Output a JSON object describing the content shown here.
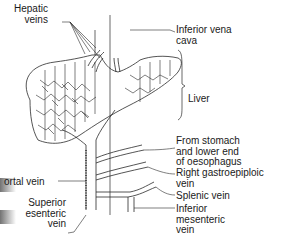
{
  "labels": {
    "hepatic_veins": "Hepatic\nveins",
    "inferior_vena_cava": "Inferior vena\ncava",
    "liver": "Liver",
    "from_stomach": "From stomach\nand lower end\nof oesophagus",
    "right_gastroepiploic": "Right gastroepiploic\nvein",
    "splenic": "Splenic vein",
    "inferior_mesenteric": "Inferior\nmesenteric\nvein",
    "portal": "ortal vein",
    "superior_mesenteric": "Superior\nesenteric\nvein"
  },
  "colors": {
    "line": "#2a2a2a",
    "background": "#ffffff"
  }
}
